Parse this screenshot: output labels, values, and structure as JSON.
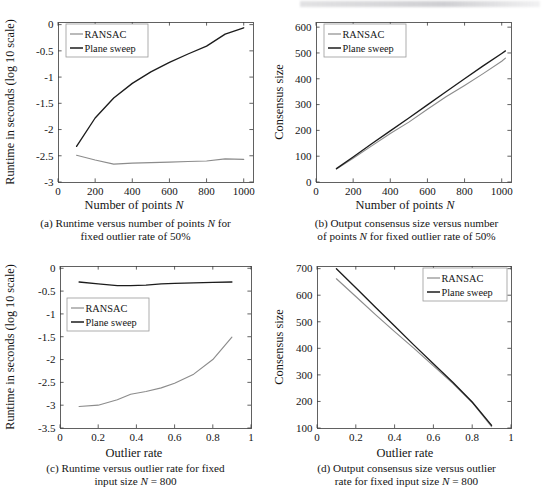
{
  "figure": {
    "panels": [
      {
        "id": "a",
        "caption_line1": "(a) Runtime versus number of points N for",
        "caption_line2": "fixed outlier rate of 50%",
        "xlabel": "Number of points N",
        "ylabel": "Runtime in seconds (log 10 scale)",
        "xticks": [
          "0",
          "200",
          "400",
          "600",
          "800",
          "1000"
        ],
        "yticks": [
          "0",
          "-0.5",
          "-1",
          "-1.5",
          "-2",
          "-2.5",
          "-3"
        ],
        "legend": [
          "RANSAC",
          "Plane sweep"
        ]
      },
      {
        "id": "b",
        "caption_line1": "(b) Output consensus size versus number",
        "caption_line2": "of points N for fixed outlier rate of 50%",
        "xlabel": "Number of points N",
        "ylabel": "Consensus size",
        "xticks": [
          "0",
          "200",
          "400",
          "600",
          "800",
          "1000"
        ],
        "yticks": [
          "600",
          "500",
          "400",
          "300",
          "200",
          "100",
          "0"
        ],
        "legend": [
          "RANSAC",
          "Plane sweep"
        ]
      },
      {
        "id": "c",
        "caption_line1": "(c) Runtime versus outlier rate for fixed",
        "caption_line2": "input size N = 800",
        "xlabel": "Outlier rate",
        "ylabel": "Runtime in seconds (log 10 scale)",
        "xticks": [
          "0",
          "0.2",
          "0.4",
          "0.6",
          "0.8",
          "1"
        ],
        "yticks": [
          "0",
          "-0.5",
          "-1",
          "-1.5",
          "-2",
          "-2.5",
          "-3",
          "-3.5"
        ],
        "legend": [
          "RANSAC",
          "Plane sweep"
        ]
      },
      {
        "id": "d",
        "caption_line1": "(d) Output consensus size versus outlier",
        "caption_line2": "rate for fixed input size N = 800",
        "xlabel": "Outlier rate",
        "ylabel": "Consensus size",
        "xticks": [
          "0",
          "0.2",
          "0.4",
          "0.6",
          "0.8",
          "1"
        ],
        "yticks": [
          "700",
          "600",
          "500",
          "400",
          "300",
          "200",
          "100"
        ],
        "legend": [
          "RANSAC",
          "Plane sweep"
        ]
      }
    ]
  },
  "colors": {
    "ransac": "#8c8c8c",
    "plane_sweep": "#1c1c1c",
    "axis": "#3a3a3a",
    "text": "#141414",
    "background": "#ffffff"
  },
  "chart_data": [
    {
      "type": "line",
      "panel": "a",
      "title": "Runtime versus number of points N for fixed outlier rate of 50%",
      "xlabel": "Number of points N",
      "ylabel": "Runtime in seconds (log 10 scale)",
      "xlim": [
        0,
        1050
      ],
      "ylim": [
        -3,
        0.05
      ],
      "grid": false,
      "legend_position": "top-left",
      "x": [
        100,
        200,
        300,
        400,
        500,
        600,
        700,
        800,
        900,
        1000
      ],
      "series": [
        {
          "name": "RANSAC",
          "color": "#8c8c8c",
          "values": [
            -2.49,
            -2.58,
            -2.66,
            -2.64,
            -2.63,
            -2.62,
            -2.61,
            -2.6,
            -2.56,
            -2.57
          ]
        },
        {
          "name": "Plane sweep",
          "color": "#1c1c1c",
          "values": [
            -2.32,
            -1.78,
            -1.4,
            -1.12,
            -0.9,
            -0.72,
            -0.56,
            -0.41,
            -0.18,
            -0.06
          ]
        }
      ]
    },
    {
      "type": "line",
      "panel": "b",
      "title": "Output consensus size versus number of points N for fixed outlier rate of 50%",
      "xlabel": "Number of points N",
      "ylabel": "Consensus size",
      "xlim": [
        0,
        1050
      ],
      "ylim": [
        0,
        620
      ],
      "grid": false,
      "legend_position": "top-left",
      "x": [
        110,
        200,
        300,
        400,
        500,
        600,
        700,
        800,
        900,
        1000,
        1020
      ],
      "series": [
        {
          "name": "RANSAC",
          "color": "#8c8c8c",
          "values": [
            50,
            92,
            140,
            188,
            232,
            282,
            330,
            374,
            420,
            468,
            480
          ]
        },
        {
          "name": "Plane sweep",
          "color": "#1c1c1c",
          "values": [
            52,
            97,
            148,
            198,
            248,
            299,
            350,
            400,
            450,
            498,
            508
          ]
        }
      ]
    },
    {
      "type": "line",
      "panel": "c",
      "title": "Runtime versus outlier rate for fixed input size N = 800",
      "xlabel": "Outlier rate",
      "ylabel": "Runtime in seconds (log 10 scale)",
      "xlim": [
        0,
        1
      ],
      "ylim": [
        -3.5,
        0.05
      ],
      "grid": false,
      "legend_position": "left",
      "x": [
        0.1,
        0.2,
        0.3,
        0.37,
        0.45,
        0.53,
        0.6,
        0.7,
        0.8,
        0.9
      ],
      "series": [
        {
          "name": "RANSAC",
          "color": "#8c8c8c",
          "values": [
            -3.03,
            -3.0,
            -2.88,
            -2.76,
            -2.7,
            -2.62,
            -2.52,
            -2.32,
            -2.0,
            -1.51
          ]
        },
        {
          "name": "Plane sweep",
          "color": "#1c1c1c",
          "values": [
            -0.3,
            -0.34,
            -0.38,
            -0.38,
            -0.37,
            -0.34,
            -0.33,
            -0.32,
            -0.31,
            -0.3
          ]
        }
      ]
    },
    {
      "type": "line",
      "panel": "d",
      "title": "Output consensus size versus outlier rate for fixed input size N = 800",
      "xlabel": "Outlier rate",
      "ylabel": "Consensus size",
      "xlim": [
        0,
        1
      ],
      "ylim": [
        100,
        710
      ],
      "grid": false,
      "legend_position": "top-right",
      "x": [
        0.1,
        0.2,
        0.3,
        0.4,
        0.5,
        0.6,
        0.7,
        0.8,
        0.9
      ],
      "series": [
        {
          "name": "RANSAC",
          "color": "#8c8c8c",
          "values": [
            662,
            595,
            528,
            463,
            400,
            334,
            268,
            196,
            105
          ]
        },
        {
          "name": "Plane sweep",
          "color": "#1c1c1c",
          "values": [
            700,
            628,
            556,
            484,
            412,
            342,
            272,
            198,
            110
          ]
        }
      ]
    }
  ]
}
